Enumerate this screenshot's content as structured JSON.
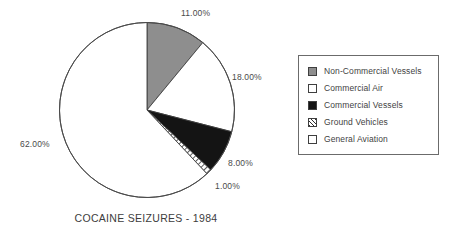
{
  "chart_data": {
    "type": "pie",
    "title": "COCAINE SEIZURES - 1984",
    "xlabel": "",
    "ylabel": "",
    "legend_position": "right",
    "grid": false,
    "start_angle_deg": 0,
    "direction": "clockwise",
    "categories": [
      "Non-Commercial Vessels",
      "Commercial Air",
      "Commercial Vessels",
      "Ground Vehicles",
      "General Aviation"
    ],
    "values": [
      11,
      18,
      8,
      1,
      62
    ],
    "value_labels": [
      "11.00%",
      "18.00%",
      "8.00%",
      "1.00%",
      "62.00%"
    ],
    "slice_fills": [
      "gray",
      "white",
      "black",
      "hatch",
      "white"
    ],
    "slice_colors": [
      "#8e8e8e",
      "#ffffff",
      "#141414",
      "#2e2e2e",
      "#ffffff"
    ]
  },
  "legend": {
    "items": [
      {
        "label": "Non-Commercial Vessels",
        "swatch": "solid-gray",
        "swatch_icon": "gray-square-swatch-icon"
      },
      {
        "label": "Commercial Air",
        "swatch": "solid-white",
        "swatch_icon": "white-square-swatch-icon"
      },
      {
        "label": "Commercial Vessels",
        "swatch": "solid-black",
        "swatch_icon": "black-square-swatch-icon"
      },
      {
        "label": "Ground Vehicles",
        "swatch": "hatch",
        "swatch_icon": "hatched-square-swatch-icon"
      },
      {
        "label": "General Aviation",
        "swatch": "solid-white",
        "swatch_icon": "white-square-swatch-icon"
      }
    ]
  },
  "style": {
    "outline_color": "#3f3f3f",
    "text_color": "#3f3f3f",
    "legend_border_color": "#6b6b6b",
    "background": "#ffffff"
  }
}
